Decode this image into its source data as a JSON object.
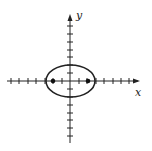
{
  "figure": {
    "type": "ellipse-graph",
    "axis_labels": {
      "x": "x",
      "y": "y"
    },
    "ellipse": {
      "center": [
        0,
        0
      ],
      "semi_major": 4.2,
      "semi_minor": 2.7,
      "orientation": "horizontal"
    },
    "foci": [
      [
        -2,
        0
      ],
      [
        2,
        0
      ]
    ],
    "x_ticks": 15,
    "y_ticks": 14,
    "colors": {
      "stroke": "#222222",
      "background": "#ffffff"
    }
  }
}
